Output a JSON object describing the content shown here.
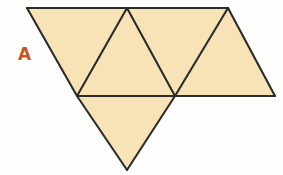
{
  "figure": {
    "kind": "polyhedron-net-diagram",
    "label": "A",
    "label_color": "#c4551f",
    "fill_color": "#f7e3b5",
    "stroke_color": "#2b2b2b",
    "background_color": "#fdfdfb",
    "canvas": {
      "width": 283,
      "height": 175
    },
    "vertices": {
      "top_left": [
        27,
        8
      ],
      "top_mid": [
        127,
        8
      ],
      "top_right": [
        228,
        8
      ],
      "mid_left": [
        77,
        96
      ],
      "mid_center": [
        175,
        96
      ],
      "mid_right": [
        275,
        96
      ],
      "bottom_apex": [
        127,
        170
      ]
    },
    "triangles": [
      {
        "name": "left-down-triangle",
        "orientation": "down",
        "points": "27,8 127,8 77,96"
      },
      {
        "name": "second-up-triangle",
        "orientation": "up",
        "points": "127,8 175,96 77,96"
      },
      {
        "name": "third-down-triangle",
        "orientation": "down",
        "points": "127,8 228,8 175,96"
      },
      {
        "name": "fourth-up-triangle",
        "orientation": "up",
        "points": "228,8 275,96 175,96"
      },
      {
        "name": "bottom-flap-triangle",
        "orientation": "down",
        "points": "77,96 175,96 127,170"
      }
    ],
    "edges": [
      {
        "name": "top-edge",
        "from": [
          27,
          8
        ],
        "to": [
          228,
          8
        ]
      },
      {
        "name": "left-slant-edge",
        "from": [
          27,
          8
        ],
        "to": [
          77,
          96
        ]
      },
      {
        "name": "fold-edge-1",
        "from": [
          127,
          8
        ],
        "to": [
          77,
          96
        ]
      },
      {
        "name": "fold-edge-2",
        "from": [
          127,
          8
        ],
        "to": [
          175,
          96
        ]
      },
      {
        "name": "fold-edge-3",
        "from": [
          228,
          8
        ],
        "to": [
          175,
          96
        ]
      },
      {
        "name": "right-slant-edge",
        "from": [
          228,
          8
        ],
        "to": [
          275,
          96
        ]
      },
      {
        "name": "horizontal-fold-edge",
        "from": [
          77,
          96
        ],
        "to": [
          275,
          96
        ]
      },
      {
        "name": "bottom-left-edge",
        "from": [
          77,
          96
        ],
        "to": [
          127,
          170
        ]
      },
      {
        "name": "bottom-right-edge",
        "from": [
          175,
          96
        ],
        "to": [
          127,
          170
        ]
      }
    ]
  }
}
